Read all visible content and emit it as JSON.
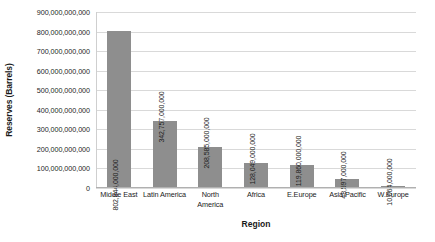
{
  "chart_data": {
    "type": "bar",
    "title": "",
    "xlabel": "Region",
    "ylabel": "Reserves (Barrels)",
    "categories": [
      "Middle East",
      "Latin America",
      "North\nAmerica",
      "Africa",
      "E.Europe",
      "Asia Pacific",
      "W.Europe"
    ],
    "values": [
      802844000000,
      342757000000,
      208585000000,
      128049000000,
      119860000000,
      48597000000,
      10064000000
    ],
    "value_labels": [
      "802,844,000,000",
      "342,757,000,000",
      "208,585,000,000",
      "128,049,000,000",
      "119,860,000,000",
      "48,597,000,000",
      "10,064,000,000"
    ],
    "ylim": [
      0,
      900000000000
    ],
    "ytick_values": [
      0,
      100000000000,
      200000000000,
      300000000000,
      400000000000,
      500000000000,
      600000000000,
      700000000000,
      800000000000,
      900000000000
    ],
    "ytick_labels": [
      "0",
      "100,000,000,000",
      "200,000,000,000",
      "300,000,000,000",
      "400,000,000,000",
      "500,000,000,000",
      "600,000,000,000",
      "700,000,000,000",
      "800,000,000,000",
      "900,000,000,000"
    ],
    "grid": true,
    "legend": false,
    "bar_color": "#8e8e8e",
    "gridline_color": "#d9d9d9",
    "background": "#ffffff"
  }
}
